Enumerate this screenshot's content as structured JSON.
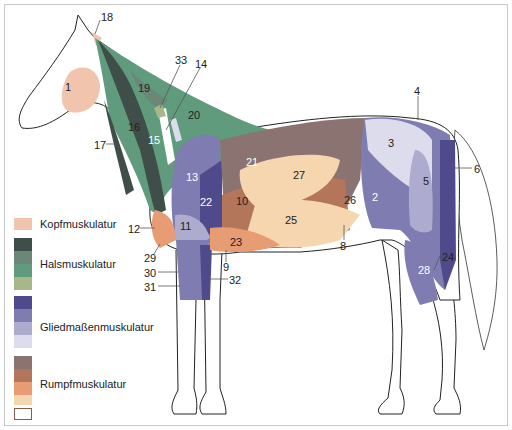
{
  "legend": [
    {
      "label": "Kopfmuskulatur",
      "colors": [
        "#f0c4ad"
      ]
    },
    {
      "label": "Halsmuskulatur",
      "colors": [
        "#3f4e48",
        "#6a8778",
        "#5f9b7c",
        "#a8b78a"
      ]
    },
    {
      "label": "Gliedmaßenmuskulatur",
      "colors": [
        "#4f4a8c",
        "#7f7cb1",
        "#aeacce",
        "#dcdcec"
      ]
    },
    {
      "label": "Rumpfmuskulatur",
      "colors": [
        "#8a7370",
        "#b4765a",
        "#e79c73",
        "#f6d6ae",
        "#ffffff"
      ]
    }
  ],
  "colors": {
    "head": "#f0c4ad",
    "neck_dark": "#3f4e48",
    "neck_mid": "#6a8778",
    "neck_green": "#5f9b7c",
    "neck_light": "#a8b78a",
    "limb_dark": "#4f4a8c",
    "limb_mid": "#7f7cb1",
    "limb_light": "#aeacce",
    "limb_pale": "#dcdcec",
    "trunk_brown": "#8a7370",
    "trunk_rust": "#b4765a",
    "trunk_orange": "#e79c73",
    "trunk_pale": "#f6d6ae"
  },
  "labels": [
    {
      "n": "1",
      "x": 65,
      "y": 82
    },
    {
      "n": "2",
      "x": 372,
      "y": 192
    },
    {
      "n": "3",
      "x": 388,
      "y": 138
    },
    {
      "n": "4",
      "x": 414,
      "y": 86
    },
    {
      "n": "5",
      "x": 423,
      "y": 176
    },
    {
      "n": "6",
      "x": 474,
      "y": 164
    },
    {
      "n": "8",
      "x": 340,
      "y": 241
    },
    {
      "n": "9",
      "x": 223,
      "y": 262
    },
    {
      "n": "10",
      "x": 236,
      "y": 196
    },
    {
      "n": "11",
      "x": 180,
      "y": 221
    },
    {
      "n": "12",
      "x": 128,
      "y": 224
    },
    {
      "n": "13",
      "x": 186,
      "y": 172
    },
    {
      "n": "14",
      "x": 195,
      "y": 59
    },
    {
      "n": "15",
      "x": 148,
      "y": 135
    },
    {
      "n": "16",
      "x": 128,
      "y": 122
    },
    {
      "n": "17",
      "x": 94,
      "y": 140
    },
    {
      "n": "18",
      "x": 101,
      "y": 12
    },
    {
      "n": "19",
      "x": 138,
      "y": 83
    },
    {
      "n": "20",
      "x": 188,
      "y": 110
    },
    {
      "n": "21",
      "x": 246,
      "y": 157
    },
    {
      "n": "22",
      "x": 200,
      "y": 197
    },
    {
      "n": "23",
      "x": 230,
      "y": 237
    },
    {
      "n": "24",
      "x": 442,
      "y": 252
    },
    {
      "n": "25",
      "x": 285,
      "y": 215
    },
    {
      "n": "26",
      "x": 344,
      "y": 195
    },
    {
      "n": "27",
      "x": 293,
      "y": 170
    },
    {
      "n": "28",
      "x": 418,
      "y": 265
    },
    {
      "n": "29",
      "x": 144,
      "y": 253
    },
    {
      "n": "30",
      "x": 144,
      "y": 268
    },
    {
      "n": "31",
      "x": 144,
      "y": 282
    },
    {
      "n": "32",
      "x": 229,
      "y": 275
    },
    {
      "n": "33",
      "x": 175,
      "y": 55
    }
  ]
}
